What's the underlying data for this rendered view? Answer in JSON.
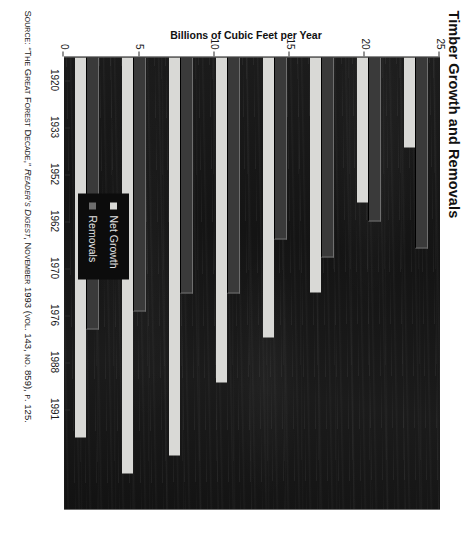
{
  "chart_data": {
    "type": "bar",
    "orientation": "horizontal-grouped",
    "title": "Timber Growth and Removals",
    "xlabel": "",
    "ylabel": "Billions of Cubic Feet per Year",
    "categories": [
      "1920",
      "1933",
      "1952",
      "1962",
      "1970",
      "1976",
      "1988",
      "1991"
    ],
    "series": [
      {
        "name": "Net Growth",
        "color": "#d9d9d6",
        "values": [
          5,
          8,
          13,
          15.5,
          18,
          22,
          23,
          21
        ]
      },
      {
        "name": "Removals",
        "color": "#3a3a3a",
        "values": [
          10.5,
          9,
          11,
          10,
          13,
          13,
          14,
          15
        ]
      }
    ],
    "value_ticks": [
      "0",
      "5",
      "10",
      "15",
      "20",
      "25"
    ],
    "value_tick_numbers": [
      0,
      5,
      10,
      15,
      20,
      25
    ],
    "ylim": [
      0,
      25
    ],
    "grid": false,
    "legend_position": "inside-lower-left",
    "background": "#171717",
    "plot_background_note": "dark scanned page"
  },
  "source": {
    "prefix": "Source:",
    "article": "“The Great Forest Decade,”",
    "publication": "Reader’s Digest",
    "issue": ", November 1993 (vol. 143, no. 859), p. 125."
  },
  "legend": {
    "items": [
      {
        "label": "Net Growth",
        "swatch": "light-square-icon"
      },
      {
        "label": "Removals",
        "swatch": "dark-square-icon"
      }
    ]
  }
}
